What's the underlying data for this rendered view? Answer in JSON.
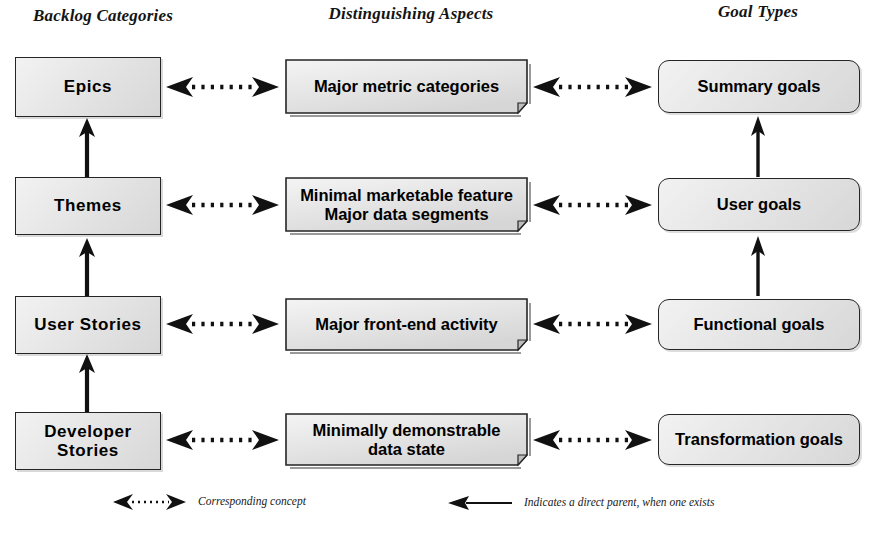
{
  "diagram": {
    "columns": [
      {
        "id": "backlog",
        "header": "Backlog Categories"
      },
      {
        "id": "aspects",
        "header": "Distinguishing Aspects"
      },
      {
        "id": "goals",
        "header": "Goal Types"
      }
    ],
    "rows": [
      {
        "id": "row-epics",
        "category": "Epics",
        "aspect": "Major metric categories",
        "aspect_lines": [
          "Major metric categories"
        ],
        "goal": "Summary goals"
      },
      {
        "id": "row-themes",
        "category": "Themes",
        "aspect": "Minimal marketable feature Major data segments",
        "aspect_lines": [
          "Minimal marketable feature",
          "Major data segments"
        ],
        "goal": "User goals"
      },
      {
        "id": "row-user-stories",
        "category": "User Stories",
        "aspect": "Major front-end activity",
        "aspect_lines": [
          "Major front-end activity"
        ],
        "goal": "Functional goals"
      },
      {
        "id": "row-developer-stories",
        "category": "Developer Stories",
        "category_lines": [
          "Developer",
          "Stories"
        ],
        "aspect": "Minimally demonstrable data state",
        "aspect_lines": [
          "Minimally demonstrable",
          "data state"
        ],
        "goal": "Transformation goals"
      }
    ],
    "legend": [
      {
        "id": "legend-corresponding",
        "icon": "double-headed-dotted-arrow-icon",
        "text": "Corresponding concept"
      },
      {
        "id": "legend-parent",
        "icon": "solid-left-arrow-icon",
        "text": "Indicates a direct parent, when one exists"
      }
    ],
    "colors": {
      "box_fill_light": "#f2f2f2",
      "box_fill_dark": "#d7d7d7",
      "box_stroke": "#252525",
      "text": "#000000",
      "arrow": "#111111",
      "background": "#ffffff"
    }
  }
}
